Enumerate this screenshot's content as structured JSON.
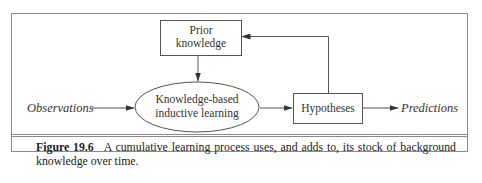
{
  "figure": {
    "nodes": {
      "prior_knowledge": {
        "line1": "Prior",
        "line2": "knowledge"
      },
      "kb_learning": {
        "line1": "Knowledge-based",
        "line2": "inductive learning"
      },
      "hypotheses": {
        "label": "Hypotheses"
      }
    },
    "inputs": {
      "observations": "Observations"
    },
    "outputs": {
      "predictions": "Predictions"
    },
    "edges": [
      {
        "from": "observations",
        "to": "kb_learning"
      },
      {
        "from": "prior_knowledge",
        "to": "kb_learning"
      },
      {
        "from": "kb_learning",
        "to": "hypotheses"
      },
      {
        "from": "hypotheses",
        "to": "predictions"
      },
      {
        "from": "hypotheses",
        "to": "prior_knowledge"
      }
    ]
  },
  "caption": {
    "figure_number": "Figure 19.6",
    "text": "A cumulative learning process uses, and adds to, its stock of background knowledge over time."
  },
  "colors": {
    "line": "#555555",
    "frame": "#8a8a8a",
    "text": "#222222"
  }
}
